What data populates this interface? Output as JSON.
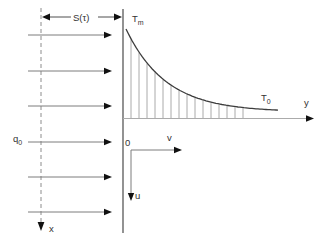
{
  "diagram": {
    "labels": {
      "s_tau": "S(τ)",
      "tm": {
        "base": "T",
        "sub": "m"
      },
      "t0": {
        "base": "T",
        "sub": "0"
      },
      "q0": {
        "base": "q",
        "sub": "0"
      },
      "y_axis": "y",
      "x_axis": "x",
      "origin": "0",
      "v": "v",
      "u": "u"
    },
    "colors": {
      "background": "#ffffff",
      "wall_line": "#4a4a4a",
      "curve_line": "#3c3c3c",
      "flux_shaft": "#7d7d7d",
      "dashed_line": "#8c8c8c",
      "hatch": "#a0a0a0",
      "axis_line": "#ababab",
      "arrowhead": "#111111",
      "text": "#333333"
    },
    "flux_arrows": {
      "count": 6,
      "y_positions": [
        35,
        71,
        106,
        142,
        177,
        212
      ],
      "x_start": 28,
      "x_shaft_end": 104,
      "x_tip": 112
    },
    "curve": {
      "x_start": 126,
      "y_start": 29,
      "y_asymptote": 112,
      "tau": 40,
      "x_end": 278
    },
    "hatch": {
      "x_start": 131,
      "spacing": 8,
      "count": 15,
      "baseline_y": 118
    }
  }
}
